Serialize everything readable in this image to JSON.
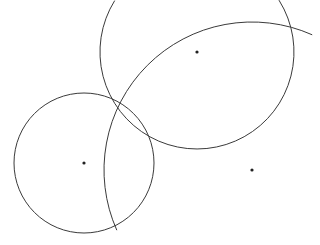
{
  "diagram": {
    "colors": {
      "stroke": "#3a3a3a",
      "point": "#222222",
      "background": "#ffffff"
    },
    "points": [
      {
        "id": "center-small-circle"
      },
      {
        "id": "center-lens-arc"
      },
      {
        "id": "center-large-arc"
      }
    ],
    "shapes": [
      {
        "id": "small-circle",
        "type": "circle",
        "center": "center-small-circle"
      },
      {
        "id": "lens-arc",
        "type": "arc",
        "center": "center-lens-arc"
      },
      {
        "id": "large-arc",
        "type": "arc",
        "center": "center-large-arc"
      }
    ]
  }
}
